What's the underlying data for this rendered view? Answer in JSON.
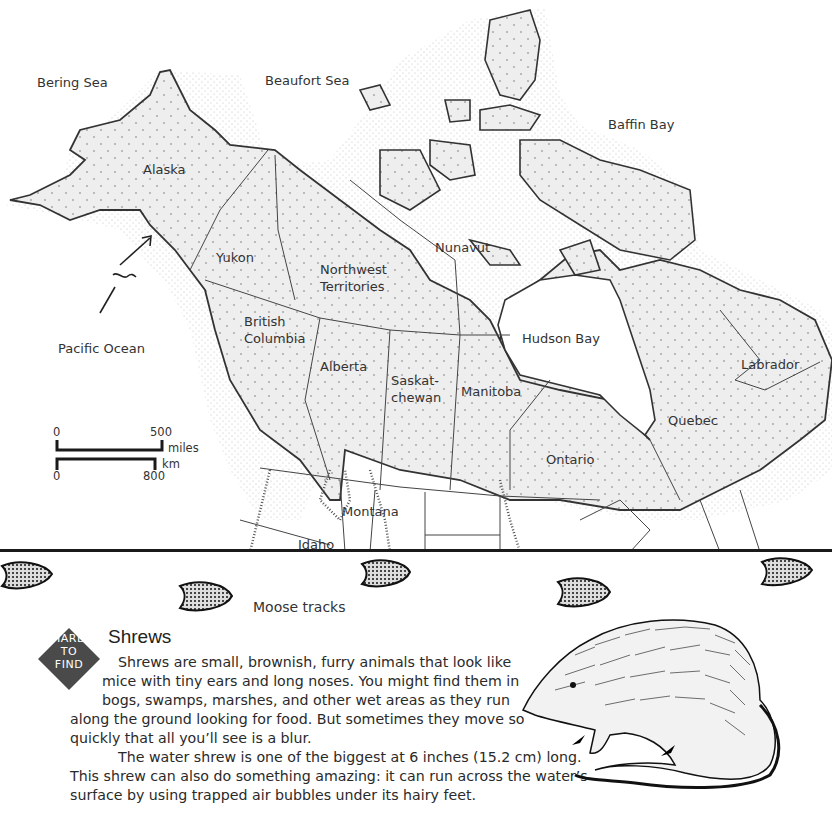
{
  "map": {
    "water_labels": [
      "Bering Sea",
      "Beaufort Sea",
      "Baffin Bay",
      "Pacific Ocean",
      "Hudson Bay"
    ],
    "regions": {
      "alaska": "Alaska",
      "yukon": "Yukon",
      "northwest_1": "Northwest",
      "northwest_2": "Territories",
      "nunavut": "Nunavut",
      "bc_1": "British",
      "bc_2": "Columbia",
      "alberta": "Alberta",
      "sask_1": "Saskat-",
      "sask_2": "chewan",
      "manitoba": "Manitoba",
      "ontario": "Ontario",
      "quebec": "Quebec",
      "labrador": "Labrador",
      "montana": "Montana",
      "idaho": "Idaho"
    },
    "scale": {
      "miles_start": "0",
      "miles_end": "500",
      "miles_unit": "miles",
      "km_start": "0",
      "km_end": "800",
      "km_unit": "km"
    },
    "colors": {
      "land": "#ececec",
      "outline": "#333333",
      "water": "#ffffff"
    }
  },
  "tracks": {
    "caption": "Moose tracks"
  },
  "article": {
    "badge": {
      "line1": "HARD",
      "line2": "TO",
      "line3": "FIND",
      "color": "#4a4a4a"
    },
    "title": "Shrews",
    "lines": [
      "Shrews are small, brownish, furry animals that look like",
      "mice with tiny ears and long noses. You might find them in",
      "bogs, swamps, marshes, and other wet areas as they run",
      "along the ground looking for food. But sometimes they move so",
      "quickly that all you’ll see is a blur.",
      "The water shrew is one of the biggest at 6 inches (15.2 cm) long.",
      "This shrew can also do something amazing: it can run across the water’s",
      "surface by using trapped air bubbles under its hairy feet."
    ]
  }
}
